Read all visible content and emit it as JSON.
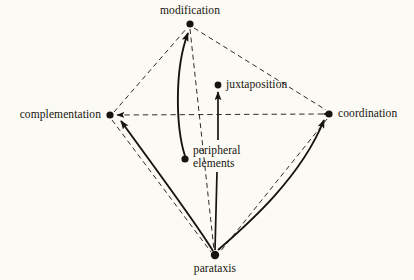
{
  "figure": {
    "type": "node-link-diagram",
    "background_color": "#fbfaf4",
    "ink_color": "#16140f",
    "width": 414,
    "height": 280
  },
  "nodes": [
    {
      "id": "modification",
      "label": "modification",
      "x": 190,
      "y": 24,
      "label_position": "above"
    },
    {
      "id": "complementation",
      "label": "complementation",
      "x": 110,
      "y": 115,
      "label_position": "left"
    },
    {
      "id": "coordination",
      "label": "coordination",
      "x": 329,
      "y": 114,
      "label_position": "right"
    },
    {
      "id": "parataxis",
      "label": "parataxis",
      "x": 215,
      "y": 255,
      "label_position": "below"
    },
    {
      "id": "juxtaposition",
      "label": "juxtaposition",
      "x": 218,
      "y": 85,
      "label_position": "right"
    },
    {
      "id": "peripheral-elements",
      "label_line1": "peripheral",
      "label_line2": "elements",
      "x": 185,
      "y": 159,
      "label_position": "right"
    }
  ],
  "edges": [
    {
      "id": "complementation-modification",
      "from": "complementation",
      "to": "modification",
      "style": "dashed",
      "arrow": "none"
    },
    {
      "id": "modification-coordination",
      "from": "modification",
      "to": "coordination",
      "style": "dashed",
      "arrow": "none"
    },
    {
      "id": "complementation-parataxis",
      "from": "complementation",
      "to": "parataxis",
      "style": "dashed",
      "arrow": "none"
    },
    {
      "id": "coordination-parataxis",
      "from": "coordination",
      "to": "parataxis",
      "style": "dashed",
      "arrow": "none"
    },
    {
      "id": "modification-parataxis",
      "from": "modification",
      "to": "parataxis",
      "style": "dashed",
      "arrow": "none"
    },
    {
      "id": "complementation-coordination",
      "from": "coordination",
      "to": "complementation",
      "style": "dashed",
      "arrow": "both"
    },
    {
      "id": "parataxis-complementation",
      "from": "parataxis",
      "to": "complementation",
      "style": "solid-curved",
      "arrow": "end"
    },
    {
      "id": "parataxis-coordination",
      "from": "parataxis",
      "to": "coordination",
      "style": "solid-curved",
      "arrow": "end"
    },
    {
      "id": "peripheral-elements-modification",
      "from": "peripheral-elements",
      "to": "modification",
      "style": "solid-curved",
      "arrow": "end"
    },
    {
      "id": "parataxis-juxtaposition",
      "from": "parataxis",
      "to": "juxtaposition",
      "style": "solid-straight",
      "arrow": "end"
    }
  ]
}
